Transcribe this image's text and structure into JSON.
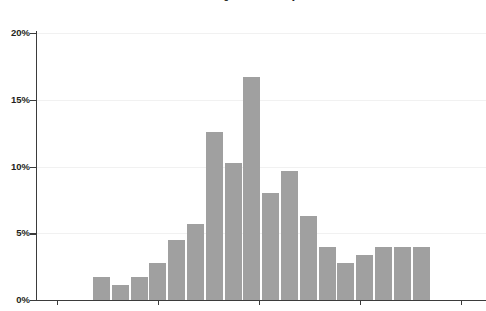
{
  "chart_data": {
    "type": "bar",
    "title": "U.S. Weight Loss Industry",
    "xlabel": "",
    "ylabel": "",
    "ylim": [
      0,
      20
    ],
    "yticks": [
      0,
      5,
      10,
      15,
      20
    ],
    "ytick_labels": [
      "0%",
      "5%",
      "10%",
      "15%",
      "20%"
    ],
    "grid": true,
    "legend": "none",
    "bar_color": "#a0a0a0",
    "axis_color": "#3b3b3b",
    "gridline_color": "#f1f1f1",
    "categories": [
      "1",
      "2",
      "3",
      "4",
      "5",
      "6",
      "7",
      "8",
      "9",
      "10",
      "11",
      "12",
      "13",
      "14",
      "15",
      "16",
      "17",
      "18"
    ],
    "values": [
      1.7,
      1.1,
      1.7,
      2.8,
      4.5,
      5.7,
      12.6,
      10.3,
      16.7,
      8.0,
      9.7,
      6.3,
      4.0,
      2.8,
      3.4,
      4.0,
      4.0,
      4.0
    ],
    "xtick_positions": [
      57,
      158,
      259,
      360,
      461
    ],
    "xtick_labels": [
      "",
      "",
      "",
      "",
      ""
    ]
  }
}
